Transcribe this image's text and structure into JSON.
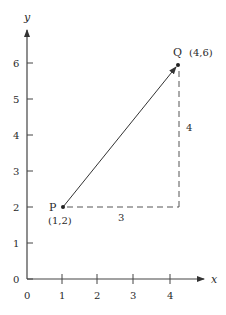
{
  "figure": {
    "axes": {
      "x_label": "x",
      "y_label": "y",
      "x_ticks": [
        "0",
        "1",
        "2",
        "3",
        "4"
      ],
      "y_ticks": [
        "0",
        "1",
        "2",
        "3",
        "4",
        "5",
        "6"
      ]
    },
    "points": {
      "P": {
        "name": "P",
        "coords": "(1,2)"
      },
      "Q": {
        "name": "Q",
        "coords": "(4,6)"
      }
    },
    "legs": {
      "horizontal": "3",
      "vertical": "4"
    }
  }
}
